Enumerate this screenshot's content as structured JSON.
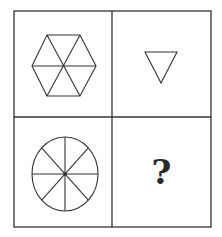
{
  "puzzle": {
    "layout": "2x2 grid",
    "line_color": "#333333",
    "cells": [
      {
        "position": "top-left",
        "shape": "hexagon divided into 6 triangles"
      },
      {
        "position": "top-right",
        "shape": "inverted triangle"
      },
      {
        "position": "bottom-left",
        "shape": "circle divided into 8 sectors"
      },
      {
        "position": "bottom-right",
        "shape": "unknown",
        "label": "?"
      }
    ]
  }
}
